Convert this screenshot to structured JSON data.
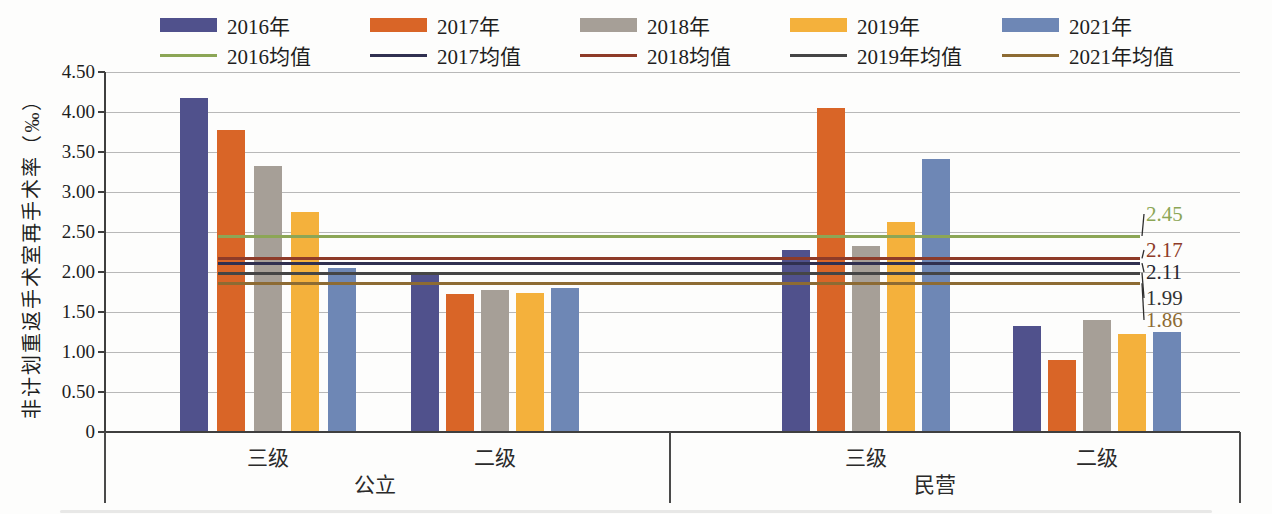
{
  "chart_data": {
    "type": "bar",
    "title": "",
    "ylabel": "非计划重返手术室再手术率（‰）",
    "ylim": [
      0,
      4.5
    ],
    "ytick_step": 0.5,
    "yticks": [
      "4.50",
      "4.00",
      "3.50",
      "3.00",
      "2.50",
      "2.00",
      "1.50",
      "1.00",
      "0.50",
      "0"
    ],
    "grid": true,
    "legend_position": "top",
    "categories": [
      "公立 三级",
      "公立 二级",
      "民营 三级",
      "民营 二级"
    ],
    "tier_labels": [
      "三级",
      "二级",
      "三级",
      "二级"
    ],
    "sector_labels": [
      "公立",
      "民营"
    ],
    "series": [
      {
        "name": "2016年",
        "color": "#50518c",
        "values": [
          4.17,
          1.98,
          2.28,
          1.33
        ]
      },
      {
        "name": "2017年",
        "color": "#d96527",
        "values": [
          3.78,
          1.73,
          4.05,
          0.9
        ]
      },
      {
        "name": "2018年",
        "color": "#a69f97",
        "values": [
          3.33,
          1.77,
          2.33,
          1.4
        ]
      },
      {
        "name": "2019年",
        "color": "#f4b13c",
        "values": [
          2.75,
          1.74,
          2.62,
          1.22
        ]
      },
      {
        "name": "2021年",
        "color": "#6e87b5",
        "values": [
          2.05,
          1.8,
          3.41,
          1.25
        ]
      }
    ],
    "mean_lines": [
      {
        "name": "2016均值",
        "value": 2.45,
        "label": "2.45",
        "color": "#8ca656",
        "label_color": "#8ca656"
      },
      {
        "name": "2017均值",
        "value": 2.11,
        "label": "2.11",
        "color": "#303050",
        "label_color": "#26262e"
      },
      {
        "name": "2018均值",
        "value": 2.17,
        "label": "2.17",
        "color": "#8e3b28",
        "label_color": "#8e3b28"
      },
      {
        "name": "2019年均值",
        "value": 1.99,
        "label": "1.99",
        "color": "#454545",
        "label_color": "#333333"
      },
      {
        "name": "2021年均值",
        "value": 1.86,
        "label": "1.86",
        "color": "#8d6b33",
        "label_color": "#8d6b33"
      }
    ]
  }
}
